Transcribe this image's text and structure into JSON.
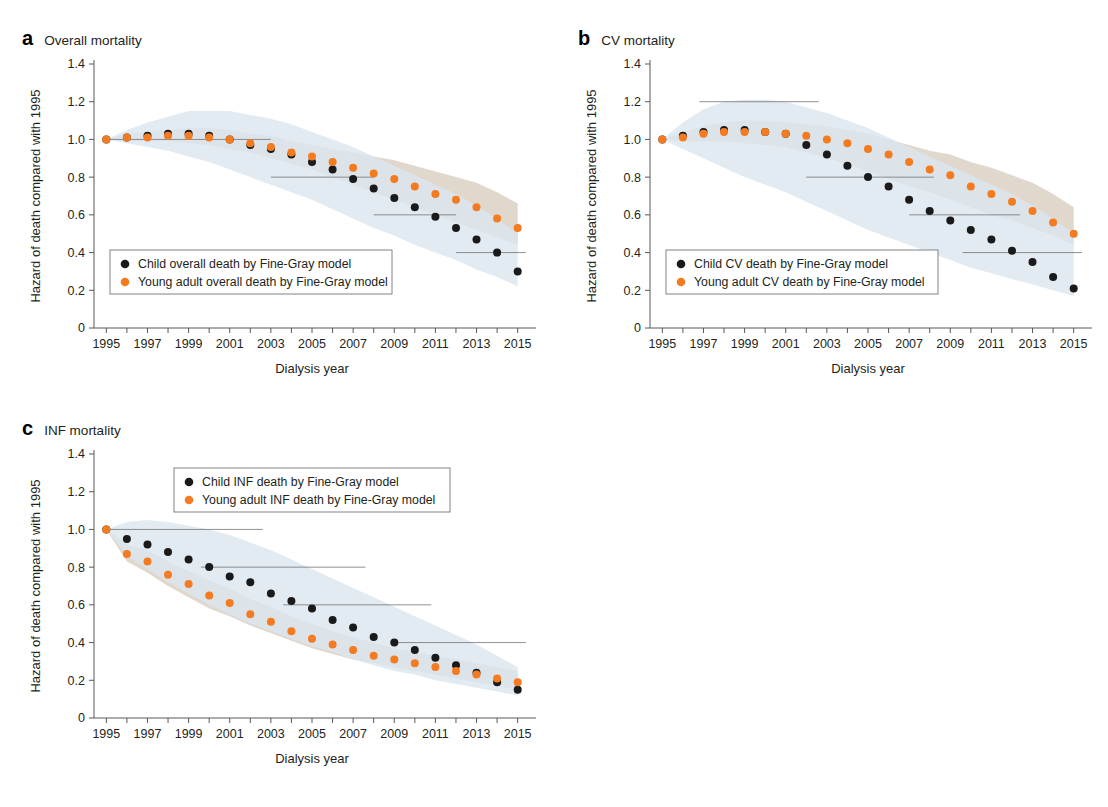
{
  "figure": {
    "axis_y_label": "Hazard of death compared with 1995",
    "axis_x_label": "Dialysis year",
    "y_ticks": [
      "0",
      "0.2",
      "0.4",
      "0.6",
      "0.8",
      "1.0",
      "1.2",
      "1.4"
    ],
    "x_ticks": [
      "1995",
      "1997",
      "1999",
      "2001",
      "2003",
      "2005",
      "2007",
      "2009",
      "2011",
      "2013",
      "2015"
    ],
    "colors": {
      "child": "#1a1a1a",
      "young_adult": "#f47b20",
      "band_child": "#dce7ef",
      "band_young_adult": "#d9cec2",
      "ci_line": "#6d6e71",
      "axis": "#58585b"
    }
  },
  "panels": [
    {
      "letter": "a",
      "title": "Overall mortality"
    },
    {
      "letter": "b",
      "title": "CV mortality"
    },
    {
      "letter": "c",
      "title": "INF mortality"
    }
  ],
  "chart_data": [
    {
      "type": "scatter",
      "panel": "a",
      "title": "Overall mortality",
      "xlabel": "Dialysis year",
      "ylabel": "Hazard of death compared with 1995",
      "xlim": [
        1994.4,
        2015.6
      ],
      "ylim": [
        0,
        1.4
      ],
      "grid": false,
      "legend_position": "lower-left",
      "x": [
        1995,
        1996,
        1997,
        1998,
        1999,
        2000,
        2001,
        2002,
        2003,
        2004,
        2005,
        2006,
        2007,
        2008,
        2009,
        2010,
        2011,
        2012,
        2013,
        2014,
        2015
      ],
      "series": [
        {
          "name": "Child overall death by Fine-Gray model",
          "color": "#1a1a1a",
          "values": [
            1.0,
            1.01,
            1.02,
            1.03,
            1.03,
            1.02,
            1.0,
            0.97,
            0.95,
            0.92,
            0.88,
            0.84,
            0.79,
            0.74,
            0.69,
            0.64,
            0.59,
            0.53,
            0.47,
            0.4,
            0.3
          ],
          "band_color": "#dce7ef",
          "band_lower": [
            1.0,
            0.98,
            0.96,
            0.94,
            0.91,
            0.88,
            0.84,
            0.8,
            0.76,
            0.72,
            0.68,
            0.63,
            0.58,
            0.53,
            0.49,
            0.44,
            0.4,
            0.36,
            0.31,
            0.27,
            0.22
          ],
          "band_upper": [
            1.0,
            1.05,
            1.09,
            1.12,
            1.15,
            1.15,
            1.15,
            1.13,
            1.11,
            1.08,
            1.04,
            1.0,
            0.96,
            0.91,
            0.86,
            0.81,
            0.76,
            0.71,
            0.65,
            0.58,
            0.5
          ]
        },
        {
          "name": "Young adult overall death by Fine-Gray model",
          "color": "#f47b20",
          "values": [
            1.0,
            1.01,
            1.01,
            1.02,
            1.02,
            1.01,
            1.0,
            0.98,
            0.96,
            0.93,
            0.91,
            0.88,
            0.85,
            0.82,
            0.79,
            0.75,
            0.71,
            0.68,
            0.64,
            0.58,
            0.53
          ],
          "band_color": "#d9cec2",
          "band_lower": [
            1.0,
            0.99,
            0.99,
            0.99,
            0.98,
            0.97,
            0.95,
            0.93,
            0.9,
            0.87,
            0.84,
            0.8,
            0.76,
            0.72,
            0.68,
            0.64,
            0.6,
            0.56,
            0.52,
            0.48,
            0.44
          ],
          "band_upper": [
            1.0,
            1.03,
            1.04,
            1.05,
            1.06,
            1.06,
            1.05,
            1.03,
            1.02,
            0.99,
            0.97,
            0.95,
            0.93,
            0.91,
            0.89,
            0.86,
            0.83,
            0.8,
            0.77,
            0.72,
            0.66
          ]
        }
      ],
      "ci_steps": [
        {
          "x0": 1995.0,
          "x1": 2003.0,
          "y": 1.0
        },
        {
          "x0": 2003.0,
          "x1": 2008.0,
          "y": 0.8
        },
        {
          "x0": 2008.0,
          "x1": 2012.0,
          "y": 0.6
        },
        {
          "x0": 2012.0,
          "x1": 2015.4,
          "y": 0.4
        }
      ]
    },
    {
      "type": "scatter",
      "panel": "b",
      "title": "CV mortality",
      "xlabel": "Dialysis year",
      "ylabel": "Hazard of death compared with 1995",
      "xlim": [
        1994.4,
        2015.6
      ],
      "ylim": [
        0,
        1.4
      ],
      "grid": false,
      "legend_position": "lower-left",
      "x": [
        1995,
        1996,
        1997,
        1998,
        1999,
        2000,
        2001,
        2002,
        2003,
        2004,
        2005,
        2006,
        2007,
        2008,
        2009,
        2010,
        2011,
        2012,
        2013,
        2014,
        2015
      ],
      "series": [
        {
          "name": "Child CV death by Fine-Gray model",
          "color": "#1a1a1a",
          "values": [
            1.0,
            1.02,
            1.04,
            1.05,
            1.05,
            1.04,
            1.03,
            0.97,
            0.92,
            0.86,
            0.8,
            0.75,
            0.68,
            0.62,
            0.57,
            0.52,
            0.47,
            0.41,
            0.35,
            0.27,
            0.21
          ],
          "band_color": "#dce7ef",
          "band_lower": [
            1.0,
            0.95,
            0.9,
            0.85,
            0.8,
            0.76,
            0.72,
            0.67,
            0.62,
            0.57,
            0.52,
            0.48,
            0.44,
            0.4,
            0.36,
            0.32,
            0.29,
            0.26,
            0.23,
            0.2,
            0.17
          ],
          "band_upper": [
            1.0,
            1.09,
            1.16,
            1.2,
            1.21,
            1.21,
            1.2,
            1.17,
            1.14,
            1.1,
            1.06,
            1.01,
            0.96,
            0.91,
            0.86,
            0.81,
            0.76,
            0.71,
            0.65,
            0.58,
            0.5
          ]
        },
        {
          "name": "Young adult CV death by Fine-Gray model",
          "color": "#f47b20",
          "values": [
            1.0,
            1.01,
            1.03,
            1.04,
            1.04,
            1.04,
            1.03,
            1.02,
            1.0,
            0.98,
            0.95,
            0.92,
            0.88,
            0.84,
            0.81,
            0.75,
            0.71,
            0.67,
            0.62,
            0.56,
            0.5
          ],
          "band_color": "#d9cec2",
          "band_lower": [
            1.0,
            0.99,
            0.99,
            0.99,
            0.98,
            0.97,
            0.96,
            0.93,
            0.9,
            0.87,
            0.83,
            0.79,
            0.75,
            0.72,
            0.68,
            0.64,
            0.6,
            0.57,
            0.53,
            0.49,
            0.44
          ],
          "band_upper": [
            1.0,
            1.04,
            1.07,
            1.09,
            1.1,
            1.1,
            1.09,
            1.08,
            1.07,
            1.05,
            1.03,
            1.0,
            0.97,
            0.94,
            0.92,
            0.88,
            0.85,
            0.81,
            0.77,
            0.71,
            0.64
          ]
        }
      ],
      "ci_steps": [
        {
          "x0": 1996.8,
          "x1": 2002.6,
          "y": 1.2
        },
        {
          "x0": 2002.0,
          "x1": 2008.2,
          "y": 0.8
        },
        {
          "x0": 2007.0,
          "x1": 2012.4,
          "y": 0.6
        },
        {
          "x0": 2009.6,
          "x1": 2015.4,
          "y": 0.4
        }
      ]
    },
    {
      "type": "scatter",
      "panel": "c",
      "title": "INF mortality",
      "xlabel": "Dialysis year",
      "ylabel": "Hazard of death compared with 1995",
      "xlim": [
        1994.4,
        2015.6
      ],
      "ylim": [
        0,
        1.4
      ],
      "grid": false,
      "legend_position": "upper-center",
      "x": [
        1995,
        1996,
        1997,
        1998,
        1999,
        2000,
        2001,
        2002,
        2003,
        2004,
        2005,
        2006,
        2007,
        2008,
        2009,
        2010,
        2011,
        2012,
        2013,
        2014,
        2015
      ],
      "series": [
        {
          "name": "Child INF death by Fine-Gray model",
          "color": "#1a1a1a",
          "values": [
            1.0,
            0.95,
            0.92,
            0.88,
            0.84,
            0.8,
            0.75,
            0.72,
            0.66,
            0.62,
            0.58,
            0.52,
            0.48,
            0.43,
            0.4,
            0.36,
            0.32,
            0.28,
            0.24,
            0.19,
            0.15
          ],
          "band_color": "#dce7ef",
          "band_lower": [
            1.0,
            0.86,
            0.79,
            0.72,
            0.66,
            0.6,
            0.55,
            0.5,
            0.46,
            0.42,
            0.38,
            0.35,
            0.31,
            0.28,
            0.25,
            0.23,
            0.2,
            0.18,
            0.16,
            0.14,
            0.12
          ],
          "band_upper": [
            1.0,
            1.04,
            1.05,
            1.04,
            1.02,
            1.0,
            0.97,
            0.93,
            0.89,
            0.84,
            0.79,
            0.74,
            0.69,
            0.64,
            0.59,
            0.54,
            0.49,
            0.44,
            0.39,
            0.33,
            0.27
          ]
        },
        {
          "name": "Young adult INF death by Fine-Gray model",
          "color": "#f47b20",
          "values": [
            1.0,
            0.87,
            0.83,
            0.76,
            0.71,
            0.65,
            0.61,
            0.55,
            0.51,
            0.46,
            0.42,
            0.39,
            0.36,
            0.33,
            0.31,
            0.29,
            0.27,
            0.25,
            0.23,
            0.21,
            0.19
          ],
          "band_color": "#d9cec2",
          "band_lower": [
            1.0,
            0.83,
            0.77,
            0.7,
            0.64,
            0.58,
            0.54,
            0.49,
            0.45,
            0.41,
            0.37,
            0.34,
            0.31,
            0.29,
            0.27,
            0.25,
            0.23,
            0.21,
            0.19,
            0.17,
            0.15
          ],
          "band_upper": [
            1.0,
            0.92,
            0.89,
            0.83,
            0.78,
            0.73,
            0.69,
            0.63,
            0.59,
            0.54,
            0.5,
            0.46,
            0.43,
            0.4,
            0.37,
            0.35,
            0.33,
            0.31,
            0.29,
            0.27,
            0.25
          ]
        }
      ],
      "ci_steps": [
        {
          "x0": 1995.0,
          "x1": 2002.6,
          "y": 1.0
        },
        {
          "x0": 1999.6,
          "x1": 2007.6,
          "y": 0.8
        },
        {
          "x0": 2003.6,
          "x1": 2010.8,
          "y": 0.6
        },
        {
          "x0": 2008.8,
          "x1": 2015.4,
          "y": 0.4
        }
      ]
    }
  ]
}
